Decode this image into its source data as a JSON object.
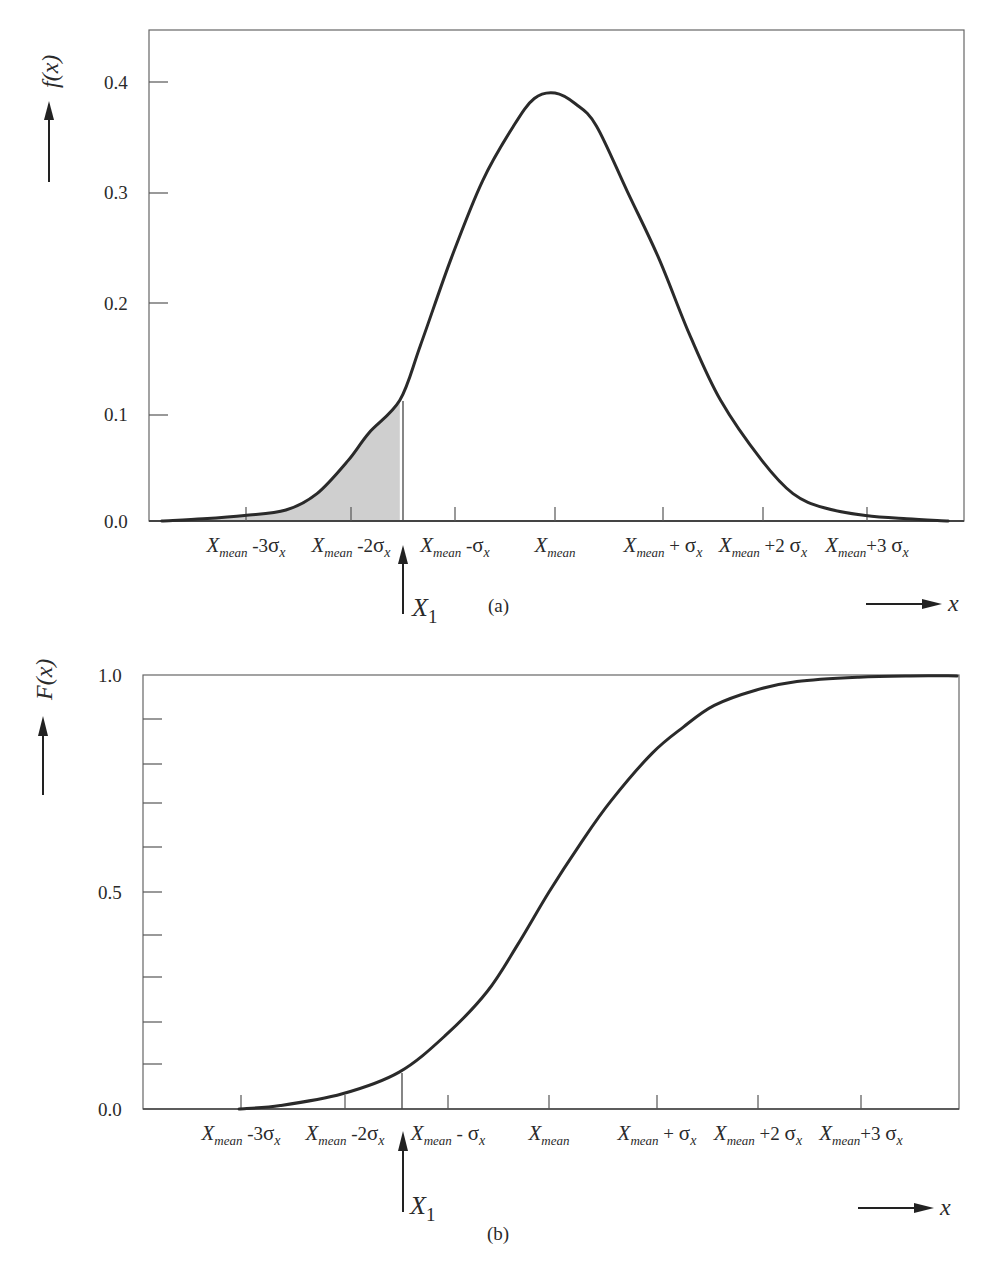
{
  "chart_data": [
    {
      "id": "a",
      "type": "area",
      "title": "",
      "caption": "(a)",
      "ylabel": "f(x)",
      "xlabel": "x",
      "ylim": [
        0,
        0.45
      ],
      "yticks": [
        0.0,
        0.1,
        0.2,
        0.3,
        0.4
      ],
      "ytick_labels": [
        "0.0",
        "0.1",
        "0.2",
        "0.3",
        "0.4"
      ],
      "xtick_labels": [
        "X_mean -3σ_x",
        "X_mean -2σ_x",
        "X_mean -σ_x",
        "X_mean",
        "X_mean + σ_x",
        "X_mean +2σ_x",
        "X_mean +3σ_x"
      ],
      "xticks_sigma": [
        -3,
        -2,
        -1,
        0,
        1,
        2,
        3
      ],
      "marker": {
        "label": "X1",
        "sigma": -1.5,
        "value": 0.11
      },
      "shaded_region": {
        "from_sigma": -3.8,
        "to_sigma": -1.5,
        "fill": "#cfcfcf",
        "description": "area under f(x) up to X1"
      },
      "grid": false,
      "series": [
        {
          "name": "f(x) normal probability density",
          "x_sigma": [
            -3.8,
            -3.4,
            -3.0,
            -2.6,
            -2.3,
            -2.0,
            -1.8,
            -1.5,
            -1.3,
            -1.0,
            -0.7,
            -0.4,
            -0.2,
            0.0,
            0.2,
            0.4,
            0.7,
            1.0,
            1.3,
            1.6,
            2.0,
            2.3,
            2.6,
            3.0,
            3.4,
            3.8
          ],
          "values": [
            0.0,
            0.002,
            0.005,
            0.01,
            0.025,
            0.055,
            0.08,
            0.11,
            0.16,
            0.24,
            0.31,
            0.36,
            0.385,
            0.39,
            0.38,
            0.36,
            0.3,
            0.24,
            0.17,
            0.11,
            0.055,
            0.025,
            0.012,
            0.005,
            0.002,
            0.0
          ]
        }
      ]
    },
    {
      "id": "b",
      "type": "line",
      "title": "",
      "caption": "(b)",
      "ylabel": "F(x)",
      "xlabel": "x",
      "ylim": [
        0,
        1.0
      ],
      "yticks": [
        0.0,
        0.1,
        0.2,
        0.3,
        0.4,
        0.5,
        0.6,
        0.7,
        0.8,
        0.9,
        1.0
      ],
      "ytick_labels": [
        "0.0",
        "",
        "",
        "",
        "",
        "0.5",
        "",
        "",
        "",
        "",
        "1.0"
      ],
      "xtick_labels": [
        "X_mean -3σ_x",
        "X_mean -2σ_x",
        "X_mean - σ_x",
        "X_mean",
        "X_mean + σ_x",
        "X_mean +2σ_x",
        "X_mean +3σ_x"
      ],
      "xticks_sigma": [
        -3,
        -2,
        -1,
        0,
        1,
        2,
        3
      ],
      "marker": {
        "label": "X1",
        "sigma": -1.45,
        "value": 0.085
      },
      "grid": false,
      "series": [
        {
          "name": "F(x) cumulative distribution",
          "x_sigma": [
            -3.0,
            -2.6,
            -2.0,
            -1.45,
            -1.0,
            -0.6,
            -0.3,
            0.0,
            0.3,
            0.6,
            1.0,
            1.3,
            1.6,
            2.0,
            2.4,
            3.0,
            3.5,
            3.95
          ],
          "values": [
            0.0,
            0.008,
            0.035,
            0.085,
            0.17,
            0.27,
            0.38,
            0.5,
            0.61,
            0.71,
            0.82,
            0.88,
            0.93,
            0.965,
            0.985,
            0.995,
            0.998,
            0.998
          ]
        }
      ]
    }
  ],
  "labels": {
    "a": {
      "ylabel_main": "f",
      "ylabel_arg": "(x)",
      "caption": "(a)",
      "x_axis": "x",
      "marker": "X",
      "marker_sub": "1",
      "y": [
        "0.0",
        "0.1",
        "0.2",
        "0.3",
        "0.4"
      ],
      "xt": [
        {
          "base": "X",
          "sub": "mean",
          "op": " -3",
          "sig": "σ",
          "ssub": "x"
        },
        {
          "base": "X",
          "sub": "mean",
          "op": " -2",
          "sig": "σ",
          "ssub": "x"
        },
        {
          "base": "X",
          "sub": "mean",
          "op": " -",
          "sig": "σ",
          "ssub": "x"
        },
        {
          "base": "X",
          "sub": "mean",
          "op": "",
          "sig": "",
          "ssub": ""
        },
        {
          "base": "X",
          "sub": "mean",
          "op": " + ",
          "sig": "σ",
          "ssub": "x"
        },
        {
          "base": "X",
          "sub": "mean",
          "op": " +2 ",
          "sig": "σ",
          "ssub": "x"
        },
        {
          "base": "X",
          "sub": "mean",
          "op": "+3 ",
          "sig": "σ",
          "ssub": "x"
        }
      ]
    },
    "b": {
      "ylabel_main": "F",
      "ylabel_arg": "(x)",
      "caption": "(b)",
      "x_axis": "x",
      "marker": "X",
      "marker_sub": "1",
      "y": [
        "0.0",
        "0.5",
        "1.0"
      ],
      "xt": [
        {
          "base": "X",
          "sub": "mean",
          "op": " -3",
          "sig": "σ",
          "ssub": "x"
        },
        {
          "base": "X",
          "sub": "mean",
          "op": " -2",
          "sig": "σ",
          "ssub": "x"
        },
        {
          "base": "X",
          "sub": "mean",
          "op": " - ",
          "sig": "σ",
          "ssub": "x"
        },
        {
          "base": "X",
          "sub": "mean",
          "op": "",
          "sig": "",
          "ssub": ""
        },
        {
          "base": "X",
          "sub": "mean",
          "op": " + ",
          "sig": "σ",
          "ssub": "x"
        },
        {
          "base": "X",
          "sub": "mean",
          "op": " +2 ",
          "sig": "σ",
          "ssub": "x"
        },
        {
          "base": "X",
          "sub": "mean",
          "op": "+3 ",
          "sig": "σ",
          "ssub": "x"
        }
      ]
    }
  },
  "colors": {
    "curve": "#2a2a2a",
    "axis": "#555555",
    "shade": "#cfcfcf"
  }
}
